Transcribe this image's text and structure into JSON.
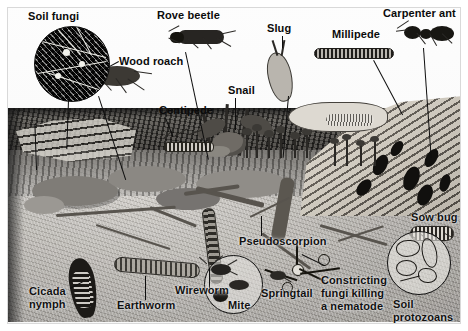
{
  "figure": {
    "medium": "pen-and-ink scientific illustration",
    "palette": {
      "ink": "#0b0b0b",
      "litter_dark": "#3a3733",
      "soil_mid": "#a9a6a1",
      "log_light": "#d8d3c8",
      "paper": "#ffffff"
    },
    "regions": [
      {
        "name": "leaf-litter-layer",
        "label": ""
      },
      {
        "name": "mineral-soil-layer",
        "label": ""
      },
      {
        "name": "rotting-log",
        "label": ""
      }
    ]
  },
  "labels": [
    {
      "id": "soil-fungi",
      "text": "Soil fungi",
      "x": 28,
      "y": 10,
      "align": "left",
      "style": "onpaper",
      "has_leader": true
    },
    {
      "id": "rove-beetle",
      "text": "Rove beetle",
      "x": 157,
      "y": 9,
      "align": "left",
      "style": "onpaper",
      "has_leader": true
    },
    {
      "id": "slug",
      "text": "Slug",
      "x": 267,
      "y": 22,
      "align": "left",
      "style": "onpaper",
      "has_leader": true
    },
    {
      "id": "millipede",
      "text": "Millipede",
      "x": 332,
      "y": 28,
      "align": "left",
      "style": "onpaper",
      "has_leader": true
    },
    {
      "id": "carpenter-ant",
      "text": "Carpenter ant",
      "x": 383,
      "y": 7,
      "align": "left",
      "style": "onpaper",
      "has_leader": true
    },
    {
      "id": "wood-roach",
      "text": "Wood roach",
      "x": 119,
      "y": 55,
      "align": "left",
      "style": "onpaper",
      "has_leader": true
    },
    {
      "id": "snail",
      "text": "Snail",
      "x": 228,
      "y": 84,
      "align": "left",
      "style": "onpaper",
      "has_leader": true
    },
    {
      "id": "centipede",
      "text": "Centipede",
      "x": 159,
      "y": 104,
      "align": "left",
      "style": "onpaper",
      "has_leader": true
    },
    {
      "id": "cicada-nymph",
      "text": "Cicada\nnymph",
      "x": 29,
      "y": 285,
      "align": "left",
      "style": "onsoil",
      "has_leader": true
    },
    {
      "id": "earthworm",
      "text": "Earthworm",
      "x": 117,
      "y": 299,
      "align": "left",
      "style": "onsoil",
      "has_leader": true
    },
    {
      "id": "wireworm",
      "text": "Wireworm",
      "x": 175,
      "y": 284,
      "align": "left",
      "style": "onsoil",
      "has_leader": true
    },
    {
      "id": "mite",
      "text": "Mite",
      "x": 228,
      "y": 299,
      "align": "left",
      "style": "onsoil",
      "has_leader": false
    },
    {
      "id": "pseudoscorpion",
      "text": "Pseudoscorpion",
      "x": 239,
      "y": 235,
      "align": "left",
      "style": "onsoil",
      "has_leader": false
    },
    {
      "id": "springtail",
      "text": "Springtail",
      "x": 261,
      "y": 287,
      "align": "left",
      "style": "onsoil",
      "has_leader": false
    },
    {
      "id": "constricting-fungi",
      "text": "Constricting\nfungi killing\na nematode",
      "x": 321,
      "y": 274,
      "align": "left",
      "style": "onsoil",
      "has_leader": true
    },
    {
      "id": "sow-bug",
      "text": "Sow bug",
      "x": 411,
      "y": 211,
      "align": "left",
      "style": "onsoil",
      "has_leader": false
    },
    {
      "id": "soil-protozoans",
      "text": "Soil\nprotozoans",
      "x": 393,
      "y": 298,
      "align": "left",
      "style": "onsoil",
      "has_leader": false
    }
  ],
  "insets": [
    {
      "id": "soil-fungi-inset",
      "kind": "dark",
      "cx": 71,
      "cy": 63,
      "r": 37,
      "caption_ref": "soil-fungi"
    },
    {
      "id": "mite-inset",
      "kind": "pale",
      "cx": 232,
      "cy": 283,
      "r": 28,
      "caption_ref": "mite"
    },
    {
      "id": "protozoans-inset",
      "kind": "pale",
      "cx": 418,
      "cy": 262,
      "r": 31,
      "caption_ref": "soil-protozoans"
    }
  ],
  "organisms": [
    {
      "id": "soil-fungi",
      "common_name": "Soil fungi",
      "habitat": "inset-microscope-view"
    },
    {
      "id": "rove-beetle",
      "common_name": "Rove beetle",
      "habitat": "surface"
    },
    {
      "id": "wood-roach",
      "common_name": "Wood roach",
      "habitat": "surface"
    },
    {
      "id": "centipede",
      "common_name": "Centipede",
      "habitat": "litter"
    },
    {
      "id": "snail",
      "common_name": "Snail",
      "habitat": "surface"
    },
    {
      "id": "slug",
      "common_name": "Slug",
      "habitat": "surface"
    },
    {
      "id": "millipede",
      "common_name": "Millipede",
      "habitat": "litter"
    },
    {
      "id": "carpenter-ant",
      "common_name": "Carpenter ant",
      "habitat": "rotting-log"
    },
    {
      "id": "sow-bug",
      "common_name": "Sow bug",
      "habitat": "soil"
    },
    {
      "id": "cicada-nymph",
      "common_name": "Cicada nymph",
      "habitat": "soil"
    },
    {
      "id": "earthworm",
      "common_name": "Earthworm",
      "habitat": "soil"
    },
    {
      "id": "wireworm",
      "common_name": "Wireworm",
      "habitat": "soil"
    },
    {
      "id": "mite",
      "common_name": "Mite",
      "habitat": "soil"
    },
    {
      "id": "springtail",
      "common_name": "Springtail",
      "habitat": "soil"
    },
    {
      "id": "pseudoscorpion",
      "common_name": "Pseudoscorpion",
      "habitat": "soil"
    },
    {
      "id": "constricting-fungi",
      "common_name": "Constricting fungi killing a nematode",
      "habitat": "soil"
    },
    {
      "id": "soil-protozoans",
      "common_name": "Soil protozoans",
      "habitat": "inset-microscope-view"
    }
  ]
}
